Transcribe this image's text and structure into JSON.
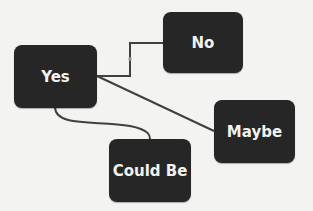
{
  "diagram": {
    "nodes": [
      {
        "id": "yes",
        "label": "Yes"
      },
      {
        "id": "no",
        "label": "No"
      },
      {
        "id": "maybe",
        "label": "Maybe"
      },
      {
        "id": "could_be",
        "label": "Could Be"
      }
    ],
    "edges": [
      {
        "from": "yes",
        "to": "no",
        "style": "elbow"
      },
      {
        "from": "yes",
        "to": "maybe",
        "style": "straight"
      },
      {
        "from": "yes",
        "to": "could_be",
        "style": "curved"
      }
    ],
    "colors": {
      "node_fill": "#262626",
      "node_text": "#f2f2f2",
      "edge": "#404040",
      "background": "#f3f3f2"
    }
  }
}
